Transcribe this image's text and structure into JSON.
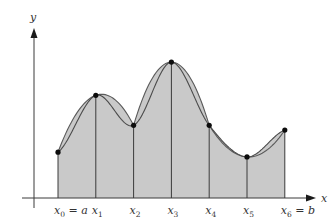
{
  "figure": {
    "axes": {
      "x_label": "x",
      "y_label": "y"
    },
    "partition": {
      "count": 7,
      "labels": [
        {
          "main": "x",
          "sub": "0",
          "suffix": " = a"
        },
        {
          "main": "x",
          "sub": "1",
          "suffix": ""
        },
        {
          "main": "x",
          "sub": "2",
          "suffix": ""
        },
        {
          "main": "x",
          "sub": "3",
          "suffix": ""
        },
        {
          "main": "x",
          "sub": "4",
          "suffix": ""
        },
        {
          "main": "x",
          "sub": "5",
          "suffix": ""
        },
        {
          "main": "x",
          "sub": "6",
          "suffix": " = b"
        }
      ],
      "relative_heights": [
        0.29,
        0.65,
        0.46,
        0.86,
        0.46,
        0.26,
        0.43
      ]
    },
    "parabola_groups": [
      [
        0,
        1,
        2
      ],
      [
        2,
        3,
        4
      ],
      [
        4,
        5,
        6
      ]
    ],
    "colors": {
      "shade": "#c9c9c9",
      "curve": "#4a4a4a",
      "point": "#0d0d0d",
      "axis": "#3a3a3a"
    }
  }
}
